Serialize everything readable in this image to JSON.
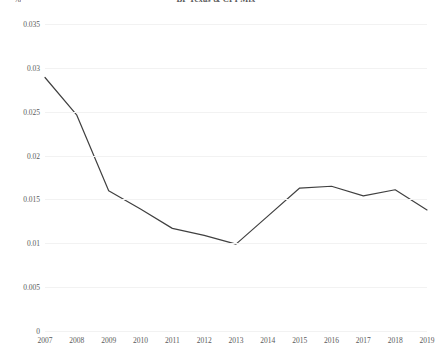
{
  "chart_data": {
    "type": "line",
    "title": "BP Texas & CPI Mix",
    "subtitle": "",
    "xlabel": "",
    "ylabel": "%",
    "y_unit_caption": "%",
    "categories": [
      2007,
      2008,
      2009,
      2010,
      2011,
      2012,
      2013,
      2014,
      2015,
      2016,
      2017,
      2018,
      2019
    ],
    "x_tick_labels": [
      "2007",
      "2008",
      "2009",
      "2010",
      "2011",
      "2012",
      "2013",
      "2014",
      "2015",
      "2016",
      "2017",
      "2018",
      "2019"
    ],
    "series": [
      {
        "name": "Share",
        "color": "#404040",
        "values": [
          0.0289,
          0.0246,
          0.016,
          0.0139,
          0.0117,
          0.0109,
          0.0099,
          0.0131,
          0.0163,
          0.0165,
          0.0154,
          0.0161,
          0.0138
        ]
      }
    ],
    "ylim": [
      0,
      0.035
    ],
    "xlim": [
      2007,
      2019
    ],
    "y_ticks": [
      0,
      0.005,
      0.01,
      0.015,
      0.02,
      0.025,
      0.03,
      0.035
    ],
    "y_tick_labels": [
      "0",
      "0.005",
      "0.01",
      "0.015",
      "0.02",
      "0.025",
      "0.03",
      "0.035"
    ],
    "grid": {
      "horizontal": true,
      "vertical": false,
      "color": "#f2f2f2"
    },
    "legend": {
      "visible": false,
      "position": "none"
    },
    "markers": false,
    "line_width": 1.2,
    "background": "#ffffff"
  }
}
